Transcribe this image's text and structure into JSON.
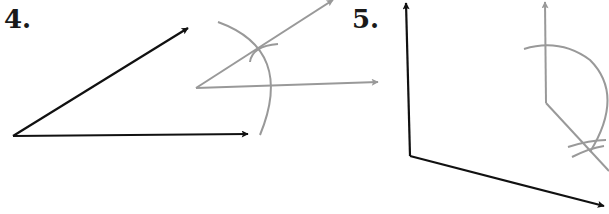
{
  "problems": [
    {
      "number": "4.",
      "description": "Copy angle: given black angle, gray construction with arcs"
    },
    {
      "number": "5.",
      "description": "Copy obtuse angle: given black angle, gray construction with arcs"
    }
  ],
  "colors": {
    "given": "#111111",
    "construction": "#999999"
  }
}
